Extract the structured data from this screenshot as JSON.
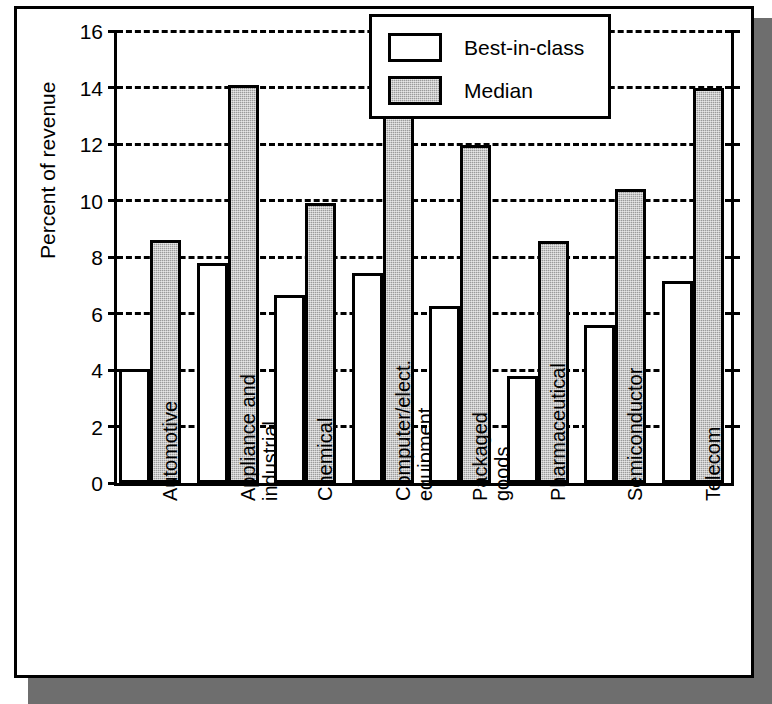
{
  "chart_data": {
    "type": "bar",
    "title": "",
    "xlabel": "",
    "ylabel": "Percent of revenue",
    "ylim": [
      0,
      16
    ],
    "ytick_labels": [
      "16",
      "14",
      "12",
      "10",
      "8",
      "6",
      "4",
      "2",
      "0"
    ],
    "ytick_values": [
      16,
      14,
      12,
      10,
      8,
      6,
      4,
      2,
      0
    ],
    "grid": true,
    "grid_style": "dashed-horizontal",
    "legend_position": "top-right",
    "categories": [
      "Automotive",
      "Appliance and\nindustrial",
      "Chemical",
      "Computer/elect.\nequipment",
      "Packaged\ngoods",
      "Pharmaceutical",
      "Semiconductor",
      "Telecom"
    ],
    "series": [
      {
        "name": "Best-in-class",
        "fill": "#ffffff",
        "values": [
          4.05,
          7.8,
          6.65,
          7.45,
          6.25,
          3.8,
          5.6,
          7.15
        ]
      },
      {
        "name": "Median",
        "fill": "#9a9a9a",
        "values": [
          8.6,
          14.1,
          9.9,
          13.55,
          11.95,
          8.55,
          10.4,
          14.0
        ]
      }
    ]
  },
  "legend": {
    "entries": [
      {
        "label": "Best-in-class",
        "swatch": "white-square-outline"
      },
      {
        "label": "Median",
        "swatch": "gray-filled-square"
      }
    ]
  },
  "colors": {
    "axis": "#000000",
    "frame": "#000000",
    "shadow": "#6e6e6e",
    "median_fill": "#9a9a9a",
    "best_fill": "#ffffff",
    "background": "#ffffff"
  }
}
